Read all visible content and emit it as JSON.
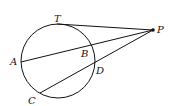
{
  "diagram": {
    "labels": {
      "T": "T",
      "P": "P",
      "A": "A",
      "B": "B",
      "C": "C",
      "D": "D"
    },
    "segments": [
      "PT",
      "PA",
      "PC"
    ],
    "colors": {
      "stroke": "#111111"
    }
  }
}
